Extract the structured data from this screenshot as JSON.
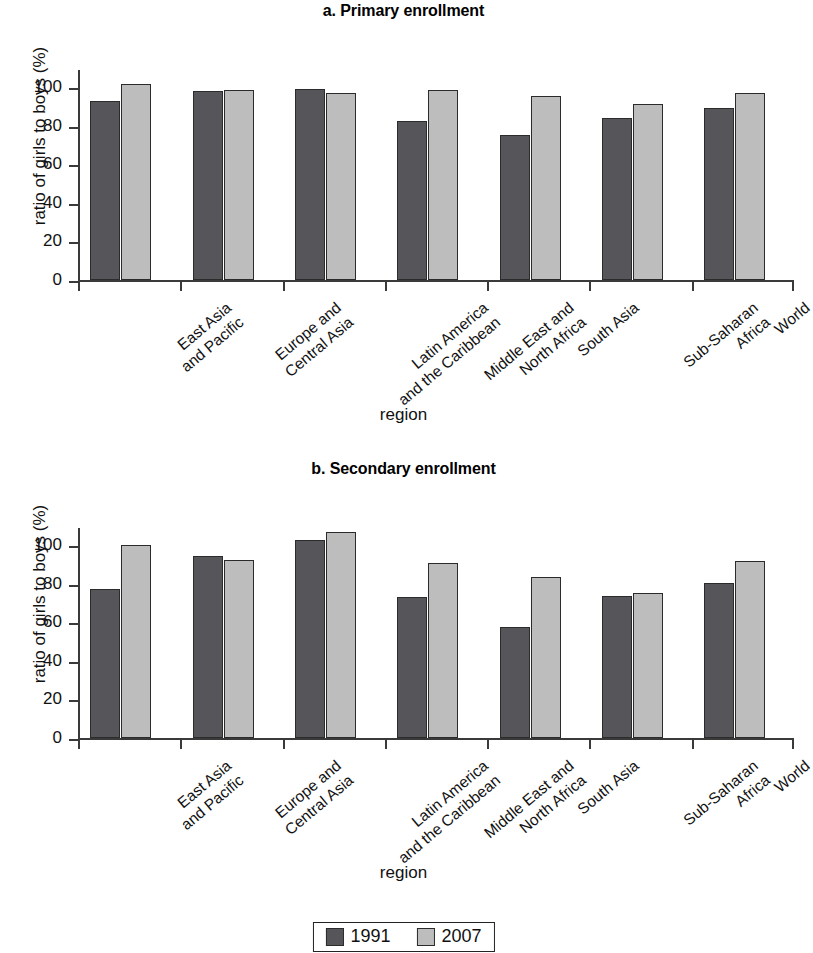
{
  "figure": {
    "xlabel": "region",
    "ylabel": "ratio of girls to boys (%)",
    "legend": [
      {
        "label": "1991",
        "color": "#55555a"
      },
      {
        "label": "2007",
        "color": "#bdbdbd"
      }
    ]
  },
  "chart_data": [
    {
      "type": "bar",
      "title": "a. Primary enrollment",
      "xlabel": "region",
      "ylabel": "ratio of girls to boys (%)",
      "ylim": [
        0,
        110
      ],
      "yticks": [
        0,
        20,
        40,
        60,
        80,
        100
      ],
      "grid": false,
      "legend_position": "bottom",
      "categories": [
        "East Asia and Pacific",
        "Europe and Central Asia",
        "Latin America and the Caribbean",
        "Middle East and North Africa",
        "South Asia",
        "Sub-Saharan Africa",
        "World"
      ],
      "series": [
        {
          "name": "1991",
          "color": "#55555a",
          "values": [
            93,
            98,
            99,
            82.5,
            75.5,
            84,
            89.5
          ]
        },
        {
          "name": "2007",
          "color": "#bdbdbd",
          "values": [
            101.5,
            98.5,
            97,
            98.5,
            95.5,
            91.5,
            97
          ]
        }
      ]
    },
    {
      "type": "bar",
      "title": "b. Secondary enrollment",
      "xlabel": "region",
      "ylabel": "ratio of girls to boys (%)",
      "ylim": [
        0,
        110
      ],
      "yticks": [
        0,
        20,
        40,
        60,
        80,
        100
      ],
      "grid": false,
      "legend_position": "bottom",
      "categories": [
        "East Asia and Pacific",
        "Europe and Central Asia",
        "Latin America and the Caribbean",
        "Middle East and North Africa",
        "South Asia",
        "Sub-Saharan Africa",
        "World"
      ],
      "series": [
        {
          "name": "1991",
          "color": "#55555a",
          "values": [
            77.5,
            94.5,
            102.5,
            73,
            57.5,
            73.5,
            80.5
          ]
        },
        {
          "name": "2007",
          "color": "#bdbdbd",
          "values": [
            100,
            92.5,
            107,
            91,
            83.5,
            75.5,
            92
          ]
        }
      ]
    }
  ],
  "category_lines": [
    [
      "East Asia",
      "and Pacific"
    ],
    [
      "Europe and",
      "Central Asia"
    ],
    [
      "Latin America",
      "and the Caribbean"
    ],
    [
      "Middle East and",
      "North Africa"
    ],
    [
      "South Asia"
    ],
    [
      "Sub-Saharan",
      "Africa"
    ],
    [
      "World"
    ]
  ]
}
